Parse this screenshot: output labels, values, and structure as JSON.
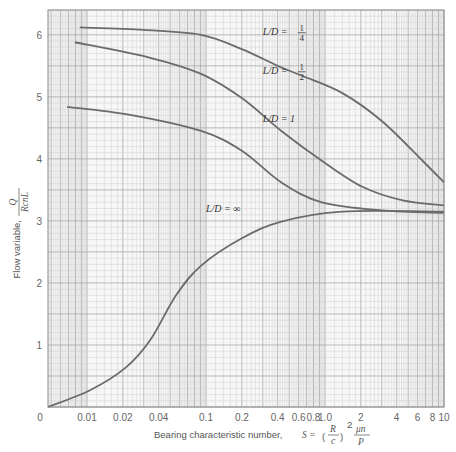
{
  "chart_data": {
    "type": "line",
    "title": "",
    "xlabel": "Bearing characteristic number, S = (R/c)^2 μn/P",
    "xlabel_parts": {
      "text": "Bearing characteristic number,",
      "formula": "S = (R/c)² μn/P"
    },
    "ylabel": "Flow variable, Q/(RcnL)",
    "ylabel_parts": {
      "text": "Flow variable,",
      "num": "Q",
      "den": "RcnL"
    },
    "xscale": "log",
    "xlim": [
      0.0047,
      10
    ],
    "ylim": [
      0,
      6.4
    ],
    "grid": true,
    "x_ticks": [
      {
        "value": 0.01,
        "label": "0.01"
      },
      {
        "value": 0.02,
        "label": "0.02"
      },
      {
        "value": 0.04,
        "label": "0.04"
      },
      {
        "value": 0.1,
        "label": "0.1"
      },
      {
        "value": 0.2,
        "label": "0.2"
      },
      {
        "value": 0.4,
        "label": "0.4"
      },
      {
        "value": 0.6,
        "label": "0.6"
      },
      {
        "value": 0.8,
        "label": "0.8"
      },
      {
        "value": 1.0,
        "label": "1.0"
      },
      {
        "value": 2,
        "label": "2"
      },
      {
        "value": 4,
        "label": "4"
      },
      {
        "value": 6,
        "label": "6"
      },
      {
        "value": 8,
        "label": "8"
      },
      {
        "value": 10,
        "label": "10"
      }
    ],
    "x_origin_label": "0",
    "y_ticks": [
      {
        "value": 1,
        "label": "1"
      },
      {
        "value": 2,
        "label": "2"
      },
      {
        "value": 3,
        "label": "3"
      },
      {
        "value": 4,
        "label": "4"
      },
      {
        "value": 5,
        "label": "5"
      },
      {
        "value": 6,
        "label": "6"
      }
    ],
    "series": [
      {
        "name": "L/D = 1/4",
        "label": {
          "prefix": "L/D =",
          "num": "1",
          "den": "4",
          "x": 0.3,
          "y": 6.05
        },
        "x": [
          0.0087,
          0.03,
          0.091,
          0.2,
          0.4,
          0.64,
          1.4,
          3.0,
          6.6,
          10
        ],
        "y": [
          6.12,
          6.08,
          6.0,
          5.77,
          5.5,
          5.34,
          5.06,
          4.61,
          3.97,
          3.62
        ]
      },
      {
        "name": "L/D = 1/2",
        "label": {
          "prefix": "L/D =",
          "num": "1",
          "den": "2",
          "x": 0.3,
          "y": 5.42
        },
        "x": [
          0.0079,
          0.034,
          0.091,
          0.2,
          0.43,
          0.94,
          2.06,
          4.5,
          10
        ],
        "y": [
          5.88,
          5.63,
          5.37,
          4.98,
          4.45,
          3.97,
          3.55,
          3.33,
          3.25
        ]
      },
      {
        "name": "L/D = 1",
        "label": {
          "prefix": "L/D = 1",
          "x": 0.3,
          "y": 4.65
        },
        "x": [
          0.0068,
          0.023,
          0.091,
          0.2,
          0.43,
          0.94,
          3.0,
          10
        ],
        "y": [
          4.84,
          4.71,
          4.45,
          4.13,
          3.62,
          3.3,
          3.17,
          3.13
        ]
      },
      {
        "name": "L/D = ∞",
        "label": {
          "prefix": "L/D = ∞",
          "x": 0.1,
          "y": 3.2
        },
        "x": [
          0.0047,
          0.0106,
          0.021,
          0.034,
          0.056,
          0.091,
          0.2,
          0.43,
          1.4,
          10
        ],
        "y": [
          0.0,
          0.27,
          0.63,
          1.08,
          1.8,
          2.28,
          2.72,
          2.99,
          3.15,
          3.15
        ]
      }
    ],
    "colors": {
      "curve": "#6b6b6b",
      "grid_minor": "#cfcfcf",
      "grid_major": "#a8a8a8",
      "frame": "#888888",
      "background": "#f7f7f7"
    }
  }
}
